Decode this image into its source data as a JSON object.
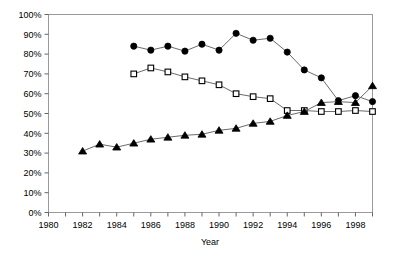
{
  "chart_data": {
    "type": "line",
    "title": "",
    "xlabel": "Year",
    "ylabel": "",
    "xlim": [
      1980,
      1999
    ],
    "ylim": [
      0,
      100
    ],
    "grid": false,
    "legend": "none",
    "x_tick_labels": [
      "1980",
      "1982",
      "1984",
      "1986",
      "1988",
      "1990",
      "1992",
      "1994",
      "1996",
      "1998"
    ],
    "x_tick_values": [
      1980,
      1982,
      1984,
      1986,
      1988,
      1990,
      1992,
      1994,
      1996,
      1998
    ],
    "x_minor_tick_values": [
      1981,
      1983,
      1985,
      1987,
      1989,
      1991,
      1993,
      1995,
      1997,
      1999
    ],
    "y_tick_labels": [
      "0%",
      "10%",
      "20%",
      "30%",
      "40%",
      "50%",
      "60%",
      "70%",
      "80%",
      "90%",
      "100%"
    ],
    "y_tick_values": [
      0,
      10,
      20,
      30,
      40,
      50,
      60,
      70,
      80,
      90,
      100
    ],
    "series": [
      {
        "name": "filled-circle-series",
        "marker": "circle",
        "marker_fill": "#000000",
        "line_color": "#6b6b6b",
        "x": [
          1985,
          1986,
          1987,
          1988,
          1989,
          1990,
          1991,
          1992,
          1993,
          1994,
          1995,
          1996,
          1997,
          1998,
          1999
        ],
        "values": [
          84,
          82,
          84,
          81.5,
          85,
          82,
          90.5,
          87,
          88,
          81,
          72,
          68,
          56.5,
          59,
          56
        ]
      },
      {
        "name": "open-square-series",
        "marker": "square",
        "marker_fill": "#ffffff",
        "line_color": "#6b6b6b",
        "x": [
          1985,
          1986,
          1987,
          1988,
          1989,
          1990,
          1991,
          1992,
          1993,
          1994,
          1995,
          1996,
          1997,
          1998,
          1999
        ],
        "values": [
          70,
          73,
          71,
          68.5,
          66.5,
          64.5,
          60,
          58.5,
          57.5,
          51.5,
          51.5,
          51,
          51,
          51.5,
          51
        ]
      },
      {
        "name": "filled-triangle-series",
        "marker": "triangle",
        "marker_fill": "#000000",
        "line_color": "#6b6b6b",
        "x": [
          1982,
          1983,
          1984,
          1985,
          1986,
          1987,
          1988,
          1989,
          1990,
          1991,
          1992,
          1993,
          1994,
          1995,
          1996,
          1997,
          1998,
          1999
        ],
        "values": [
          31,
          34.5,
          33,
          35,
          37,
          38,
          39,
          39.5,
          41.5,
          42.5,
          45,
          46,
          49,
          51,
          55.5,
          56,
          55.5,
          64
        ]
      }
    ]
  }
}
